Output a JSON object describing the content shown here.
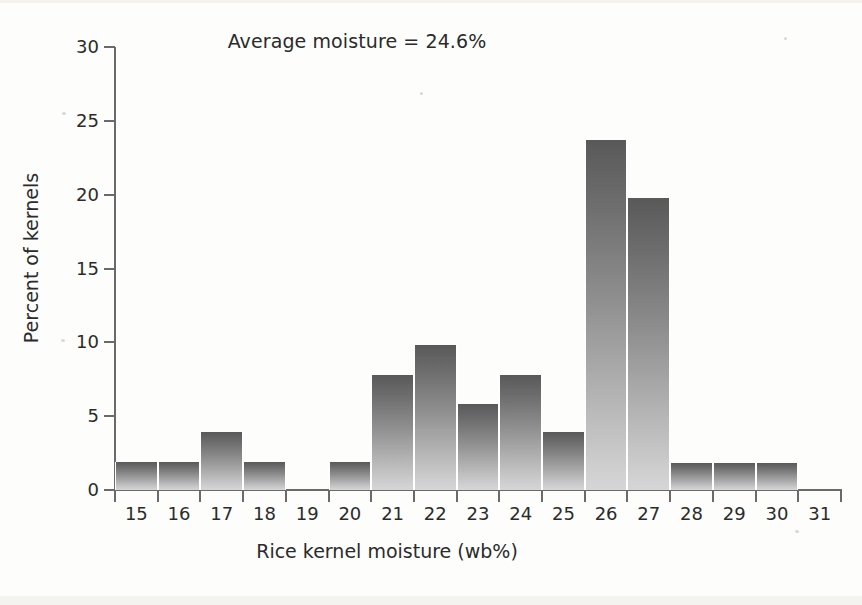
{
  "chart_data": {
    "type": "bar",
    "title": "Average moisture = 24.6%",
    "xlabel": "Rice kernel moisture (wb%)",
    "ylabel": "Percent of kernels",
    "categories": [
      "15",
      "16",
      "17",
      "18",
      "19",
      "20",
      "21",
      "22",
      "23",
      "24",
      "25",
      "26",
      "27",
      "28",
      "29",
      "30",
      "31"
    ],
    "values": [
      1.9,
      1.9,
      3.9,
      1.9,
      0,
      1.9,
      7.8,
      9.8,
      5.8,
      7.8,
      3.9,
      23.7,
      19.8,
      1.8,
      1.8,
      1.8,
      0
    ],
    "xlim": [
      15,
      32
    ],
    "ylim": [
      0,
      30
    ],
    "yticks": [
      0,
      5,
      10,
      15,
      20,
      25,
      30
    ],
    "ytick_labels": [
      "0",
      "5",
      "10",
      "15",
      "20",
      "25",
      "30"
    ],
    "xtick_labels": [
      "15",
      "16",
      "17",
      "18",
      "19",
      "20",
      "21",
      "22",
      "23",
      "24",
      "25",
      "26",
      "27",
      "28",
      "29",
      "30",
      "31"
    ],
    "grid": false,
    "legend": null,
    "annotations": [
      {
        "text": "Average moisture = 24.6%",
        "position": "top-center"
      }
    ],
    "bar_color_top": "#595959",
    "bar_color_bottom": "#d6d6d6",
    "axis_color": "#6a6a6a",
    "background": "#fdfdfc"
  }
}
